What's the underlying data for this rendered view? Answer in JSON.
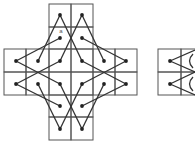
{
  "diagram": {
    "width": 195,
    "height": 144,
    "colors": {
      "background": "#ffffff",
      "grid": "#555555",
      "line": "#333333",
      "dot": "#222222"
    },
    "main_figure": {
      "grid_cells": [
        [
          49,
          4,
          22,
          23
        ],
        [
          71,
          4,
          22,
          23
        ],
        [
          49,
          27,
          22,
          22
        ],
        [
          71,
          27,
          22,
          22
        ],
        [
          4,
          49,
          22,
          23
        ],
        [
          26,
          49,
          23,
          23
        ],
        [
          49,
          49,
          22,
          23
        ],
        [
          71,
          49,
          22,
          23
        ],
        [
          93,
          49,
          22,
          23
        ],
        [
          115,
          49,
          22,
          23
        ],
        [
          4,
          72,
          22,
          23
        ],
        [
          26,
          72,
          23,
          23
        ],
        [
          49,
          72,
          22,
          23
        ],
        [
          71,
          72,
          22,
          23
        ],
        [
          93,
          72,
          22,
          23
        ],
        [
          115,
          72,
          22,
          23
        ],
        [
          49,
          95,
          22,
          22
        ],
        [
          71,
          95,
          22,
          22
        ],
        [
          49,
          117,
          22,
          23
        ],
        [
          71,
          117,
          22,
          23
        ]
      ],
      "dots": [
        [
          60,
          15
        ],
        [
          82,
          15
        ],
        [
          60,
          38
        ],
        [
          82,
          38
        ],
        [
          16,
          61
        ],
        [
          38,
          61
        ],
        [
          60,
          61
        ],
        [
          82,
          61
        ],
        [
          104,
          61
        ],
        [
          126,
          61
        ],
        [
          16,
          84
        ],
        [
          38,
          84
        ],
        [
          60,
          84
        ],
        [
          82,
          84
        ],
        [
          104,
          84
        ],
        [
          126,
          84
        ],
        [
          60,
          106
        ],
        [
          82,
          106
        ],
        [
          60,
          129
        ],
        [
          82,
          129
        ]
      ],
      "lines": [
        [
          60,
          15,
          38,
          61
        ],
        [
          60,
          15,
          82,
          61
        ],
        [
          82,
          15,
          104,
          61
        ],
        [
          82,
          15,
          60,
          61
        ],
        [
          126,
          61,
          82,
          38
        ],
        [
          126,
          61,
          82,
          84
        ],
        [
          126,
          84,
          82,
          106
        ],
        [
          126,
          84,
          82,
          61
        ],
        [
          82,
          129,
          104,
          84
        ],
        [
          82,
          129,
          60,
          84
        ],
        [
          60,
          129,
          38,
          84
        ],
        [
          60,
          129,
          82,
          84
        ],
        [
          16,
          84,
          60,
          106
        ],
        [
          16,
          84,
          60,
          61
        ],
        [
          16,
          61,
          60,
          38
        ],
        [
          16,
          61,
          60,
          84
        ]
      ],
      "labels": [
        {
          "text": "a",
          "x": 61,
          "y": 33
        }
      ]
    },
    "partial_figure": {
      "grid_cells": [
        [
          158,
          49,
          23,
          23
        ],
        [
          181,
          49,
          23,
          23
        ],
        [
          158,
          72,
          23,
          23
        ],
        [
          181,
          72,
          23,
          23
        ]
      ],
      "dots": [
        [
          170,
          61
        ],
        [
          170,
          84
        ]
      ],
      "lines": [
        [
          170,
          61,
          195,
          50
        ],
        [
          170,
          61,
          195,
          72
        ],
        [
          170,
          84,
          195,
          72
        ],
        [
          170,
          84,
          195,
          95
        ]
      ],
      "arcs": [
        "M193,54 Q186,61 193,68",
        "M193,77 Q186,84 193,91"
      ]
    }
  }
}
